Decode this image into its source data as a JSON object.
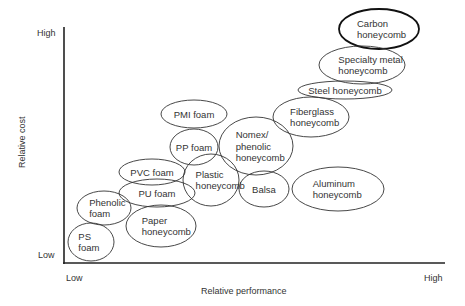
{
  "chart_data": {
    "type": "bubble-map",
    "title": "",
    "xlabel": "Relative performance",
    "ylabel": "Relative cost",
    "x_ticks": [
      "Low",
      "High"
    ],
    "y_ticks": [
      "Low",
      "High"
    ],
    "grid": false,
    "legend": null,
    "items": [
      {
        "name": "Carbon honeycomb",
        "lines": [
          "Carbon",
          "honeycomb"
        ],
        "cx": 379,
        "cy": 29,
        "rx": 40,
        "ry": 20,
        "emphasis": true
      },
      {
        "name": "Specialty metal honeycomb",
        "lines": [
          "Specialty metal",
          "honeycomb"
        ],
        "cx": 362,
        "cy": 65,
        "rx": 43,
        "ry": 19
      },
      {
        "name": "Steel honeycomb",
        "lines": [
          "Steel honeycomb"
        ],
        "cx": 345,
        "cy": 90,
        "rx": 47,
        "ry": 9
      },
      {
        "name": "Fiberglass honeycomb",
        "lines": [
          "Fiberglass",
          "honeycomb"
        ],
        "cx": 311,
        "cy": 117,
        "rx": 38,
        "ry": 20
      },
      {
        "name": "PMI foam",
        "lines": [
          "PMI foam"
        ],
        "cx": 194,
        "cy": 114,
        "rx": 33,
        "ry": 14
      },
      {
        "name": "PP foam",
        "lines": [
          "PP foam"
        ],
        "cx": 194,
        "cy": 147,
        "rx": 24,
        "ry": 18
      },
      {
        "name": "Nomex/phenolic honeycomb",
        "lines": [
          "Nomex/",
          "phenolic",
          "honeycomb"
        ],
        "cx": 256,
        "cy": 146,
        "rx": 37,
        "ry": 29
      },
      {
        "name": "PVC foam",
        "lines": [
          "PVC foam"
        ],
        "cx": 152,
        "cy": 172,
        "rx": 33,
        "ry": 13
      },
      {
        "name": "Plastic honeycomb",
        "lines": [
          "Plastic",
          "honeycomb"
        ],
        "cx": 211,
        "cy": 180,
        "rx": 28,
        "ry": 26
      },
      {
        "name": "Balsa",
        "lines": [
          "Balsa"
        ],
        "cx": 264,
        "cy": 189,
        "rx": 25,
        "ry": 18
      },
      {
        "name": "Aluminum honeycomb",
        "lines": [
          "Aluminum",
          "honeycomb"
        ],
        "cx": 338,
        "cy": 189,
        "rx": 46,
        "ry": 22
      },
      {
        "name": "PU foam",
        "lines": [
          "PU foam"
        ],
        "cx": 157,
        "cy": 193,
        "rx": 38,
        "ry": 14
      },
      {
        "name": "Phenolic foam",
        "lines": [
          "Phenolic",
          "foam"
        ],
        "cx": 104,
        "cy": 208,
        "rx": 27,
        "ry": 17
      },
      {
        "name": "Paper honeycomb",
        "lines": [
          "Paper",
          "honeycomb"
        ],
        "cx": 161,
        "cy": 226,
        "rx": 35,
        "ry": 21
      },
      {
        "name": "PS foam",
        "lines": [
          "PS",
          "foam"
        ],
        "cx": 91,
        "cy": 242,
        "rx": 23,
        "ry": 19
      }
    ]
  },
  "axes": {
    "y_label": "Relative cost",
    "x_label": "Relative performance",
    "y_high": "High",
    "y_low": "Low",
    "x_low": "Low",
    "x_high": "High"
  }
}
